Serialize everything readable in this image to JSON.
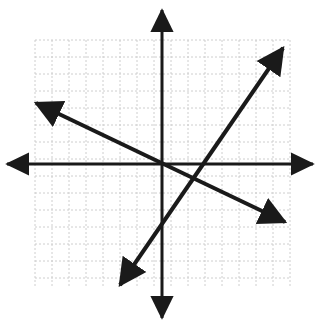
{
  "figure": {
    "title": "",
    "background_color": "#ffffff",
    "width": 321,
    "height": 326
  },
  "chart_data": {
    "type": "line",
    "title": "",
    "xlabel": "",
    "ylabel": "",
    "grid": {
      "visible": true,
      "style": "dashed",
      "color": "#c8c8c8",
      "cell_size_px": 17,
      "columns": 15,
      "rows": 14.6,
      "left_px": 35,
      "top_px": 40,
      "right_px": 290,
      "bottom_px": 288
    },
    "axes": {
      "color": "#1a1a1a",
      "line_width_px": 3,
      "origin_px": [
        162,
        164
      ],
      "x_axis": {
        "from_px": [
          7,
          164
        ],
        "to_px": [
          313,
          164
        ],
        "arrow_start": true,
        "arrow_end": true,
        "xlim_units": [
          -9.1,
          8.9
        ]
      },
      "y_axis": {
        "from_px": [
          162,
          10
        ],
        "to_px": [
          162,
          318
        ],
        "arrow_start": true,
        "arrow_end": true,
        "ylim_units": [
          -9.1,
          9.1
        ]
      }
    },
    "unit_px": 17,
    "series": [
      {
        "name": "rising-line",
        "color": "#1a1a1a",
        "line_width_px": 4,
        "arrow_start": true,
        "arrow_end": true,
        "endpoints_px": [
          [
            120,
            285
          ],
          [
            283,
            48
          ]
        ],
        "endpoints_units": [
          [
            -2.5,
            -7.1
          ],
          [
            7.1,
            6.8
          ]
        ],
        "slope": 1.45,
        "y_intercept_units": -3.5,
        "equation": "y = 1.45x - 3.5"
      },
      {
        "name": "falling-line",
        "color": "#1a1a1a",
        "line_width_px": 4,
        "arrow_start": true,
        "arrow_end": true,
        "endpoints_px": [
          [
            36,
            103
          ],
          [
            285,
            222
          ]
        ],
        "endpoints_units": [
          [
            -7.4,
            3.6
          ],
          [
            7.2,
            -3.4
          ]
        ],
        "slope": -0.48,
        "y_intercept_units": 0.05,
        "equation": "y = -0.48x"
      }
    ],
    "legend": {
      "visible": false,
      "position": "none",
      "entries": []
    },
    "tick_labels": {
      "x": [],
      "y": []
    },
    "annotations": []
  },
  "icons": {
    "arrow_head": "arrowhead-icon",
    "grid": "grid-icon"
  }
}
